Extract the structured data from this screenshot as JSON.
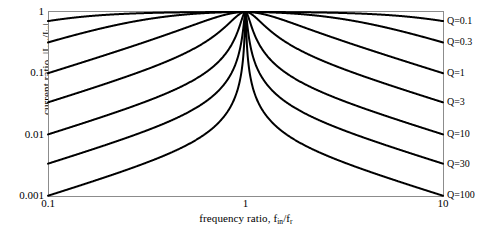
{
  "chart_data": {
    "type": "line",
    "title": "",
    "xlabel": "frequency ratio, f_in/f_r",
    "ylabel": "current ratio, |I_out/I_in|",
    "xscale": "log",
    "yscale": "log",
    "xlim": [
      0.1,
      10
    ],
    "ylim": [
      0.001,
      1
    ],
    "grid": false,
    "legend_position": "right-outside",
    "xticks": [
      "0.1",
      "1",
      "10"
    ],
    "xtick_values": [
      0.1,
      1,
      10
    ],
    "yticks": [
      "1",
      "0.1",
      "0.01",
      "0.001"
    ],
    "ytick_values": [
      1,
      0.1,
      0.01,
      0.001
    ],
    "formula": "|Iout/Iin| = 1 / sqrt(1 + Q^2 * (f/fr - fr/f)^2)",
    "series": [
      {
        "name": "Q=0.1",
        "q": 0.1,
        "x": [
          0.1,
          0.15,
          0.2,
          0.3,
          0.5,
          0.7,
          1.0,
          1.4,
          2.0,
          3.3,
          5.0,
          6.7,
          10.0
        ],
        "values": [
          0.712,
          0.836,
          0.897,
          0.954,
          0.989,
          0.998,
          1.0,
          0.998,
          0.989,
          0.954,
          0.897,
          0.836,
          0.712
        ]
      },
      {
        "name": "Q=0.3",
        "q": 0.3,
        "x": [
          0.1,
          0.15,
          0.2,
          0.3,
          0.5,
          0.7,
          1.0,
          1.4,
          2.0,
          3.3,
          5.0,
          6.7,
          10.0
        ],
        "values": [
          0.319,
          0.482,
          0.588,
          0.741,
          0.916,
          0.981,
          1.0,
          0.981,
          0.916,
          0.741,
          0.588,
          0.482,
          0.319
        ]
      },
      {
        "name": "Q=1",
        "q": 1,
        "x": [
          0.1,
          0.15,
          0.2,
          0.3,
          0.5,
          0.7,
          1.0,
          1.4,
          2.0,
          3.3,
          5.0,
          6.7,
          10.0
        ],
        "values": [
          0.101,
          0.154,
          0.208,
          0.329,
          0.555,
          0.828,
          1.0,
          0.828,
          0.555,
          0.329,
          0.208,
          0.154,
          0.101
        ]
      },
      {
        "name": "Q=3",
        "q": 3,
        "x": [
          0.1,
          0.15,
          0.2,
          0.3,
          0.5,
          0.7,
          1.0,
          1.4,
          2.0,
          3.3,
          5.0,
          6.7,
          10.0
        ],
        "values": [
          0.0337,
          0.0523,
          0.0714,
          0.118,
          0.2182,
          0.4043,
          1.0,
          0.4043,
          0.2182,
          0.118,
          0.0714,
          0.0523,
          0.0337
        ]
      },
      {
        "name": "Q=10",
        "q": 10,
        "x": [
          0.1,
          0.15,
          0.2,
          0.3,
          0.5,
          0.7,
          1.0,
          1.4,
          2.0,
          3.3,
          5.0,
          6.7,
          10.0
        ],
        "values": [
          0.0101,
          0.0157,
          0.0215,
          0.0358,
          0.0667,
          0.1373,
          1.0,
          0.1373,
          0.0667,
          0.0358,
          0.0215,
          0.0157,
          0.0101
        ]
      },
      {
        "name": "Q=30",
        "q": 30,
        "x": [
          0.1,
          0.15,
          0.2,
          0.3,
          0.5,
          0.7,
          1.0,
          1.4,
          2.0,
          3.3,
          5.0,
          6.7,
          10.0
        ],
        "values": [
          0.00337,
          0.00524,
          0.00717,
          0.01195,
          0.02222,
          0.04664,
          1.0,
          0.04664,
          0.02222,
          0.01195,
          0.00717,
          0.00524,
          0.00337
        ]
      },
      {
        "name": "Q=100",
        "q": 100,
        "x": [
          0.1,
          0.15,
          0.2,
          0.3,
          0.5,
          0.7,
          1.0,
          1.4,
          2.0,
          3.3,
          5.0,
          6.7,
          10.0
        ],
        "values": [
          0.00101,
          0.00157,
          0.00215,
          0.00359,
          0.00667,
          0.014,
          1.0,
          0.014,
          0.00667,
          0.00359,
          0.00215,
          0.00157,
          0.00101
        ]
      }
    ],
    "legend": [
      "Q=0.1",
      "Q=0.3",
      "Q=1",
      "Q=3",
      "Q=10",
      "Q=30",
      "Q=100"
    ]
  },
  "axes": {
    "y_label_prefix": "current ratio, |I",
    "y_label_sub1": "out",
    "y_label_mid": "/I",
    "y_label_sub2": "in",
    "y_label_suffix": "|",
    "x_label_prefix": "frequency ratio, f",
    "x_label_sub1": "in",
    "x_label_mid": "/f",
    "x_label_sub2": "r"
  },
  "style": {
    "curve_color": "#000000",
    "frame_color": "#808080",
    "background": "#ffffff",
    "text_color": "#000000"
  }
}
